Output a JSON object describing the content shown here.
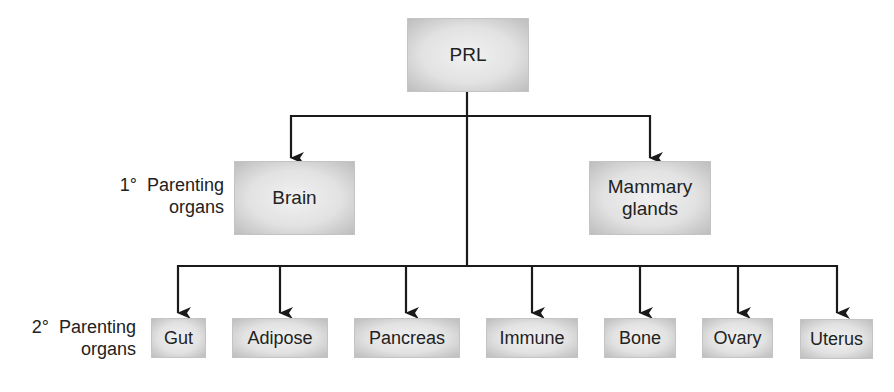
{
  "diagram": {
    "root": {
      "label": "PRL"
    },
    "primary": {
      "row_label": {
        "prefix": "1°",
        "line1": "Parenting",
        "line2": "organs"
      },
      "nodes": [
        {
          "id": "brain",
          "label": "Brain"
        },
        {
          "id": "mammary",
          "line1": "Mammary",
          "line2": "glands"
        }
      ]
    },
    "secondary": {
      "row_label": {
        "prefix": "2°",
        "line1": "Parenting",
        "line2": "organs"
      },
      "nodes": [
        {
          "id": "gut",
          "label": "Gut"
        },
        {
          "id": "adipose",
          "label": "Adipose"
        },
        {
          "id": "pancreas",
          "label": "Pancreas"
        },
        {
          "id": "immune",
          "label": "Immune"
        },
        {
          "id": "bone",
          "label": "Bone"
        },
        {
          "id": "ovary",
          "label": "Ovary"
        },
        {
          "id": "uterus",
          "label": "Uterus"
        }
      ]
    },
    "edges": [
      [
        "PRL",
        "Brain"
      ],
      [
        "PRL",
        "Mammary glands"
      ],
      [
        "PRL",
        "Gut"
      ],
      [
        "PRL",
        "Adipose"
      ],
      [
        "PRL",
        "Pancreas"
      ],
      [
        "PRL",
        "Immune"
      ],
      [
        "PRL",
        "Bone"
      ],
      [
        "PRL",
        "Ovary"
      ],
      [
        "PRL",
        "Uterus"
      ]
    ],
    "colors": {
      "line": "#1a1a1a",
      "box_fill": "#e2e2e2",
      "box_edge": "#bdbdbd"
    }
  }
}
